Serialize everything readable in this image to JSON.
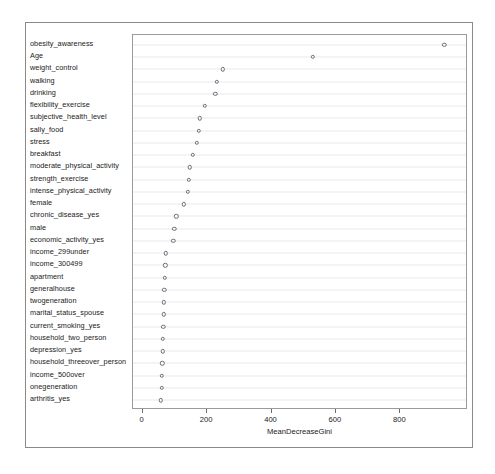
{
  "chart_data": {
    "type": "scatter",
    "title": "",
    "xlabel": "MeanDecreaseGini",
    "ylabel": "",
    "xlim": [
      -30,
      1010
    ],
    "xticks": [
      0,
      200,
      400,
      600,
      800
    ],
    "xticklabels": [
      "0",
      "200",
      "400",
      "600",
      "800"
    ],
    "grid": true,
    "grid_axis": "y",
    "legend": "none",
    "marker": "open-circle",
    "categories": [
      "obesity_awareness",
      "Age",
      "weight_control",
      "walking",
      "drinking",
      "flexibility_exercise",
      "subjective_health_level",
      "sally_food",
      "stress",
      "breakfast",
      "moderate_physical_activity",
      "strength_exercise",
      "intense_physical_activity",
      "female",
      "chronic_disease_yes",
      "male",
      "economic_activity_yes",
      "income_299under",
      "income_300499",
      "apartment",
      "generalhouse",
      "twogeneration",
      "marital_status_spouse",
      "current_smoking_yes",
      "household_two_person",
      "depression_yes",
      "household_threeover_person",
      "income_500over",
      "onegeneration",
      "arthritis_yes"
    ],
    "values": [
      937,
      529,
      249,
      231,
      226,
      193,
      178,
      174,
      168,
      155,
      146,
      143,
      140,
      128,
      105,
      98,
      95,
      72,
      70,
      68,
      67,
      66,
      65,
      64,
      63,
      62,
      61,
      60,
      59,
      57
    ]
  },
  "axis": {
    "x_title": "MeanDecreaseGini"
  }
}
